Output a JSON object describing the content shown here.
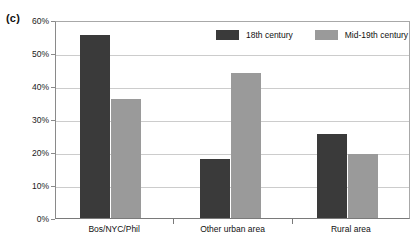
{
  "panel": {
    "label": "(c)"
  },
  "chart_data": {
    "type": "bar",
    "title": "",
    "subtitle": "",
    "xlabel": "",
    "ylabel": "",
    "categories": [
      "Bos/NYC/Phil",
      "Other urban area",
      "Rural area"
    ],
    "series": [
      {
        "name": "18th century",
        "color": "#3a3a3a",
        "values": [
          55.5,
          18.0,
          25.5
        ]
      },
      {
        "name": "Mid-19th century",
        "color": "#9a9a9a",
        "values": [
          36.0,
          44.0,
          19.3
        ]
      }
    ],
    "ylim": [
      0,
      60
    ],
    "ytick_values": [
      0,
      10,
      20,
      30,
      40,
      50,
      60
    ],
    "ytick_labels": [
      "0%",
      "10%",
      "20%",
      "30%",
      "40%",
      "50%",
      "60%"
    ],
    "grid": true,
    "grid_axis": "y",
    "grid_color": "#cccccc",
    "legend_position": "top-right-inside",
    "value_suffix": "%"
  },
  "legend": {
    "items": [
      {
        "label": "18th century",
        "color": "#3a3a3a",
        "swatch": "legend-swatch-dark"
      },
      {
        "label": "Mid-19th century",
        "color": "#9a9a9a",
        "swatch": "legend-swatch-light"
      }
    ]
  },
  "axis": {
    "y_labels": [
      "60%",
      "50%",
      "40%",
      "30%",
      "20%",
      "10%",
      "0%"
    ],
    "x_labels": [
      "Bos/NYC/Phil",
      "Other urban area",
      "Rural area"
    ]
  }
}
